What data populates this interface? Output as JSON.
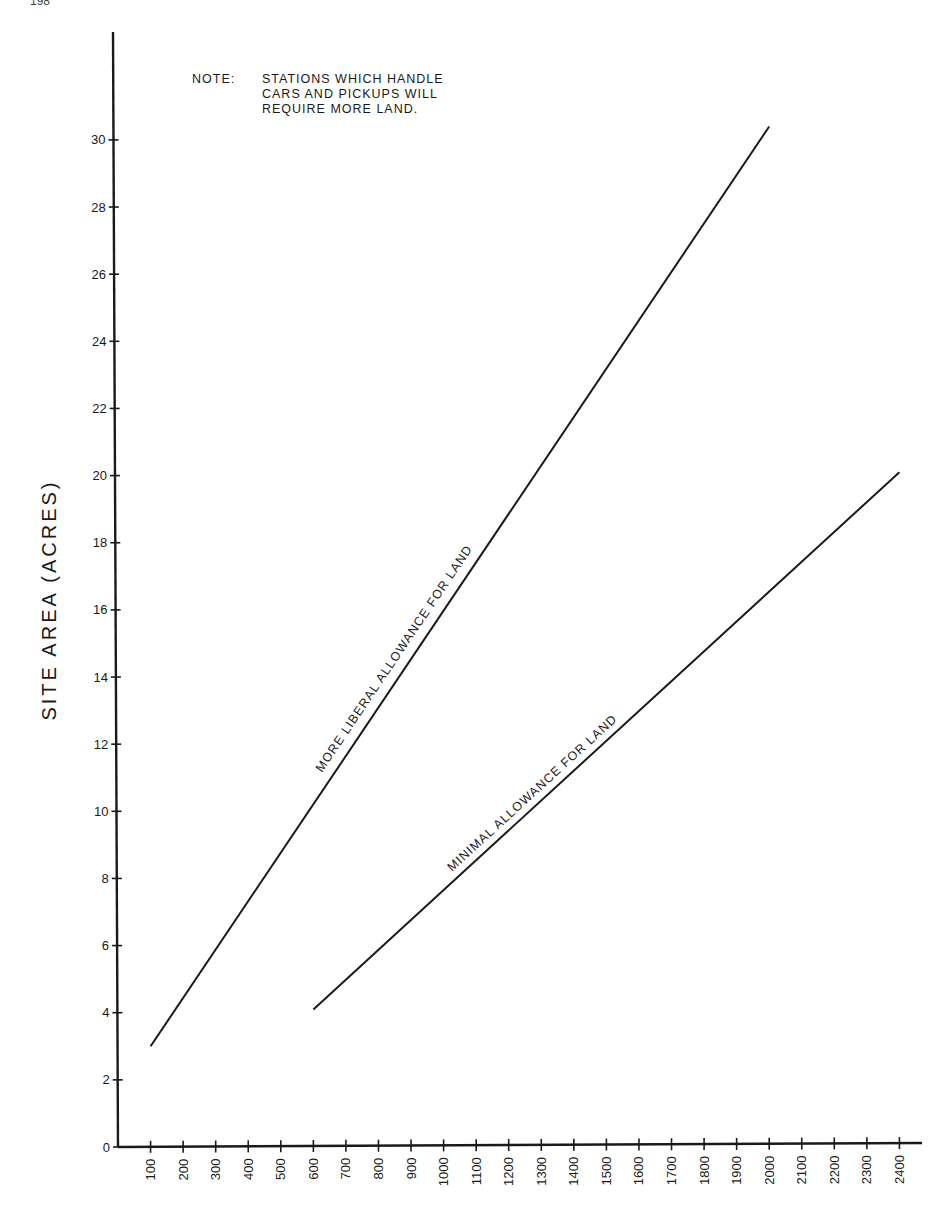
{
  "page": {
    "page_number": "198"
  },
  "note": {
    "label": "NOTE:",
    "text": "STATIONS WHICH HANDLE\nCARS AND PICKUPS WILL\nREQUIRE MORE LAND."
  },
  "chart_data": {
    "type": "line",
    "title": "",
    "xlabel": "",
    "ylabel": "SITE AREA (ACRES)",
    "xlim": [
      0,
      2400
    ],
    "ylim": [
      0,
      30
    ],
    "x_ticks": [
      100,
      200,
      300,
      400,
      500,
      600,
      700,
      800,
      900,
      1000,
      1100,
      1200,
      1300,
      1400,
      1500,
      1600,
      1700,
      1800,
      1900,
      2000,
      2100,
      2200,
      2300,
      2400
    ],
    "y_ticks": [
      0,
      2,
      4,
      6,
      8,
      10,
      12,
      14,
      16,
      18,
      20,
      22,
      24,
      26,
      28,
      30
    ],
    "grid": false,
    "legend": "none (lines labeled inline)",
    "series": [
      {
        "name": "MORE LIBERAL ALLOWANCE FOR LAND",
        "x": [
          100,
          2000
        ],
        "y": [
          3.0,
          30.4
        ]
      },
      {
        "name": "MINIMAL ALLOWANCE FOR LAND",
        "x": [
          600,
          2400
        ],
        "y": [
          4.1,
          20.1
        ]
      }
    ],
    "annotations": [
      "NOTE: STATIONS WHICH HANDLE CARS AND PICKUPS WILL REQUIRE MORE LAND."
    ]
  }
}
